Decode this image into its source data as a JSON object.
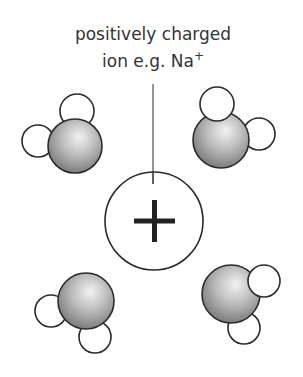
{
  "diagram": {
    "title_line1": "positively charged",
    "title_line2_prefix": "ion e.g. Na",
    "title_line2_superscript": "+",
    "ion_symbol": "+",
    "ion": {
      "cx": 154,
      "cy": 221,
      "r": 49
    },
    "leader_line": {
      "x": 153,
      "y1": 84,
      "y2": 184
    },
    "colors": {
      "stroke": "#2a2a2a",
      "text": "#333333",
      "oxygen_highlight": "#f2f2f2",
      "oxygen_mid": "#b8b8b8",
      "oxygen_edge": "#6e6e6e",
      "hydrogen_fill": "#ffffff"
    },
    "molecules": [
      {
        "name": "water-top-left",
        "oxygen": {
          "cx": 75,
          "cy": 146,
          "r": 27
        },
        "hydrogens": [
          {
            "cx": 77,
            "cy": 111,
            "r": 17,
            "above": false
          },
          {
            "cx": 38,
            "cy": 141,
            "r": 16,
            "above": false
          }
        ]
      },
      {
        "name": "water-top-right",
        "oxygen": {
          "cx": 221,
          "cy": 140,
          "r": 28
        },
        "hydrogens": [
          {
            "cx": 217,
            "cy": 104,
            "r": 17,
            "above": true
          },
          {
            "cx": 259,
            "cy": 134,
            "r": 16,
            "above": false
          }
        ]
      },
      {
        "name": "water-bottom-left",
        "oxygen": {
          "cx": 86,
          "cy": 301,
          "r": 28
        },
        "hydrogens": [
          {
            "cx": 51,
            "cy": 311,
            "r": 16,
            "above": false
          },
          {
            "cx": 95,
            "cy": 337,
            "r": 16,
            "above": false
          }
        ]
      },
      {
        "name": "water-bottom-right",
        "oxygen": {
          "cx": 231,
          "cy": 294,
          "r": 29
        },
        "hydrogens": [
          {
            "cx": 264,
            "cy": 281,
            "r": 16,
            "above": true
          },
          {
            "cx": 244,
            "cy": 328,
            "r": 16,
            "above": false
          }
        ]
      }
    ]
  }
}
